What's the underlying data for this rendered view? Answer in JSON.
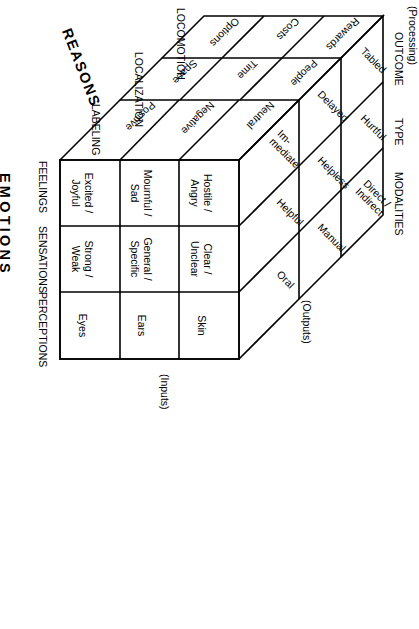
{
  "figure": {
    "kind": "three-dimensional-cube-model",
    "axis_titles": {
      "depth": "REASONS",
      "rows": "EMOTIONS",
      "columns_top": "MODALITIES"
    },
    "side_captions": {
      "left": "(Processing)",
      "right": "(Inputs)",
      "top_right": "(Outputs)"
    }
  },
  "depth_axis": {
    "name": "REASONS",
    "layer_titles": [
      "OUTCOME",
      "TYPE",
      "MODALITIES"
    ],
    "row_group_labels": [
      "LOCOMOTION",
      "LOCALIZATION",
      "LABELING"
    ],
    "slabs": [
      {
        "title": "OUTCOME",
        "values": [
          "Rewards",
          "Costs",
          "Options"
        ]
      },
      {
        "title": "TYPE",
        "values": [
          "People",
          "Time",
          "Space"
        ]
      },
      {
        "title": "MODALITIES",
        "values": [
          "Neutral",
          "Negative",
          "Positive"
        ]
      }
    ]
  },
  "top_face": {
    "columns": [
      {
        "group": "OUTCOME",
        "labels": [
          "Tabled",
          "Delayed",
          "Im-\nmediate"
        ]
      },
      {
        "group": "TYPE",
        "labels": [
          "Hurtful",
          "Helpless",
          "Helpful"
        ]
      },
      {
        "group": "MODALITIES",
        "labels": [
          "Direct /\nIndirect",
          "Manual",
          "Oral"
        ]
      }
    ],
    "flat_labels": [
      "Tabled",
      "Delayed",
      "Im- mediate",
      "Hurtful",
      "Helpless",
      "Helpful",
      "Direct / Indirect",
      "Manual",
      "Oral"
    ]
  },
  "front_grid": {
    "row_headers": [
      "FEELINGS",
      "SENSATIONS",
      "PERCEPTIONS"
    ],
    "column_headers": [
      "Positive",
      "Negative",
      "Neutral"
    ],
    "rows": [
      {
        "header": "FEELINGS",
        "cells": [
          "Excited /\nJoyful",
          "Mournful /\nSad",
          "Hostile /\nAngry"
        ]
      },
      {
        "header": "SENSATIONS",
        "cells": [
          "Strong /\nWeak",
          "General /\nSpecific",
          "Clear /\nUnclear"
        ]
      },
      {
        "header": "PERCEPTIONS",
        "cells": [
          "Eyes",
          "Ears",
          "Skin"
        ]
      }
    ]
  },
  "cells_flat": {
    "r0c0": "Excited /\nJoyful",
    "r0c1": "Mournful /\nSad",
    "r0c2": "Hostile /\nAngry",
    "r1c0": "Strong /\nWeak",
    "r1c1": "General /\nSpecific",
    "r1c2": "Clear /\nUnclear",
    "r2c0": "Eyes",
    "r2c1": "Ears",
    "r2c2": "Skin"
  },
  "colors": {
    "stroke": "#000000",
    "background": "#ffffff",
    "text": "#000000"
  }
}
